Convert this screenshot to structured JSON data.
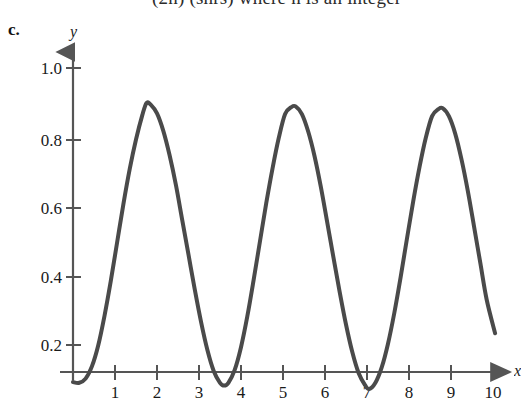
{
  "header": {
    "clipped_text_fragment": "(2n) (shrs) where n is an integer"
  },
  "part_label": "c.",
  "axes": {
    "y_label": "y",
    "x_label": "x"
  },
  "chart_data": {
    "type": "line",
    "title": "",
    "xlabel": "x",
    "ylabel": "y",
    "xlim": [
      0,
      10.6
    ],
    "ylim": [
      0,
      1.1
    ],
    "grid": false,
    "legend": null,
    "x_ticks": [
      1,
      2,
      3,
      4,
      5,
      6,
      7,
      8,
      9,
      10
    ],
    "x_tick_labels": [
      "1",
      "2",
      "3",
      "4",
      "5",
      "6",
      "7",
      "8",
      "9",
      "10"
    ],
    "y_ticks": [
      0.2,
      0.4,
      0.6,
      0.8,
      1.0
    ],
    "y_tick_labels": [
      "0.2",
      "0.4",
      "0.6",
      "0.8",
      "1.0"
    ],
    "line_color": "#4a4a4a",
    "line_width": 4,
    "axis_color": "#555555",
    "peaks": [
      {
        "x": 1.75,
        "y": 0.9
      },
      {
        "x": 5.3,
        "y": 0.89
      },
      {
        "x": 8.8,
        "y": 0.885
      }
    ],
    "troughs": [
      {
        "x": 3.6,
        "y": 0.09
      },
      {
        "x": 7.05,
        "y": 0.08
      }
    ],
    "endpoints": [
      {
        "x": 0.0,
        "y": 0.1
      },
      {
        "x": 10.05,
        "y": 0.24
      }
    ],
    "series": [
      {
        "name": "curve",
        "x": [
          0.0,
          0.15,
          0.3,
          0.45,
          0.6,
          0.75,
          0.9,
          1.05,
          1.2,
          1.35,
          1.5,
          1.65,
          1.75,
          1.85,
          2.0,
          2.15,
          2.3,
          2.45,
          2.6,
          2.75,
          2.9,
          3.05,
          3.2,
          3.35,
          3.5,
          3.6,
          3.7,
          3.85,
          4.0,
          4.15,
          4.3,
          4.45,
          4.6,
          4.75,
          4.9,
          5.05,
          5.2,
          5.3,
          5.45,
          5.6,
          5.75,
          5.9,
          6.05,
          6.2,
          6.35,
          6.5,
          6.65,
          6.8,
          6.95,
          7.05,
          7.2,
          7.35,
          7.5,
          7.65,
          7.8,
          7.95,
          8.1,
          8.25,
          8.4,
          8.55,
          8.7,
          8.8,
          8.95,
          9.1,
          9.25,
          9.4,
          9.55,
          9.7,
          9.85,
          10.05
        ],
        "y": [
          0.1,
          0.098,
          0.11,
          0.145,
          0.205,
          0.29,
          0.39,
          0.5,
          0.61,
          0.71,
          0.795,
          0.865,
          0.9,
          0.895,
          0.87,
          0.82,
          0.75,
          0.665,
          0.565,
          0.465,
          0.365,
          0.272,
          0.192,
          0.132,
          0.098,
          0.09,
          0.098,
          0.135,
          0.2,
          0.288,
          0.392,
          0.502,
          0.612,
          0.712,
          0.8,
          0.868,
          0.888,
          0.89,
          0.868,
          0.818,
          0.748,
          0.66,
          0.56,
          0.458,
          0.358,
          0.265,
          0.186,
          0.126,
          0.092,
          0.08,
          0.098,
          0.142,
          0.21,
          0.298,
          0.4,
          0.51,
          0.618,
          0.716,
          0.8,
          0.862,
          0.882,
          0.885,
          0.862,
          0.812,
          0.738,
          0.648,
          0.545,
          0.44,
          0.336,
          0.24
        ]
      }
    ]
  }
}
